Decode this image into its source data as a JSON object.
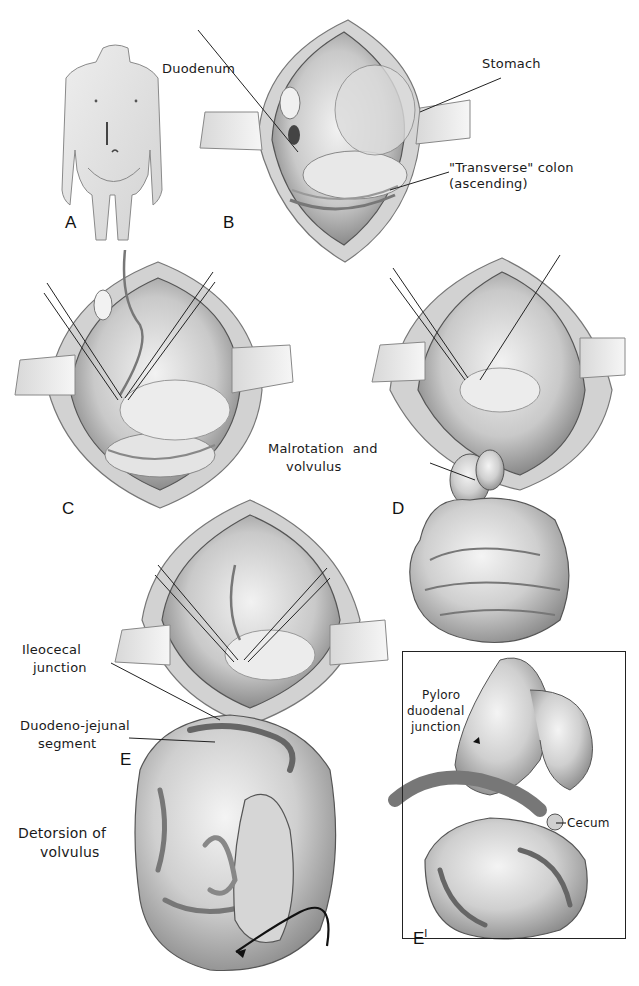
{
  "figure": {
    "type": "surgical illustration",
    "panels": [
      {
        "id": "A",
        "letter": "A",
        "description": "child torso with upper midline incision"
      },
      {
        "id": "B",
        "letter": "B",
        "description": "open abdomen showing duodenum, stomach, transverse colon"
      },
      {
        "id": "C",
        "letter": "C",
        "description": "open abdomen with retracted structures and sutures"
      },
      {
        "id": "D",
        "letter": "D",
        "description": "malrotation and volvulus of small bowel"
      },
      {
        "id": "E",
        "letter": "E",
        "description": "detorsion of volvulus by hand"
      },
      {
        "id": "E1",
        "letter": "E",
        "superscript": "I",
        "description": "inset: pyloroduodenal junction and cecum"
      }
    ],
    "labels": {
      "duodenum": "Duodenum",
      "stomach": "Stomach",
      "transverse_colon_line1": "\"Transverse\" colon",
      "transverse_colon_line2": "(ascending)",
      "malrotation_line1": "Malrotation  and",
      "malrotation_line2": "volvulus",
      "ileocecal_line1": "Ileocecal",
      "ileocecal_line2": "junction",
      "duodenojejunal_line1": "Duodeno-jejunal",
      "duodenojejunal_line2": "segment",
      "detorsion_line1": "Detorsion of",
      "detorsion_line2": "volvulus",
      "pyloro_line1": "Pyloro",
      "pyloro_line2": "duodenal",
      "pyloro_line3": "junction",
      "cecum": "Cecum"
    }
  },
  "colors": {
    "ink": "#1a1a1a",
    "tissue_light": "#e6e6e6",
    "tissue_mid": "#bdbdbd",
    "tissue_dark": "#6e6e6e",
    "background": "#ffffff"
  }
}
